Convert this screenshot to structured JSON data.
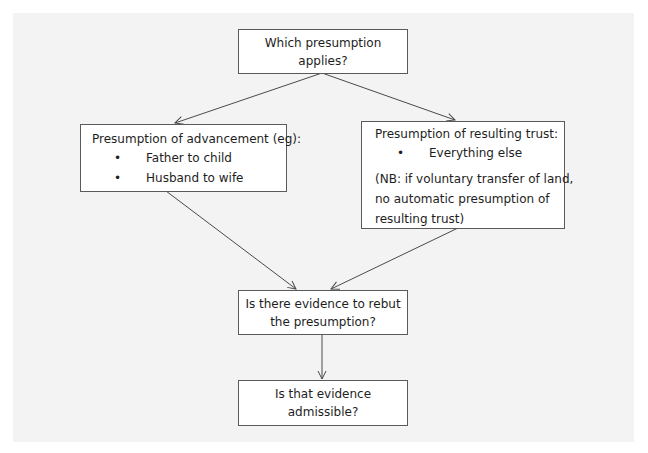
{
  "diagram": {
    "type": "flowchart",
    "nodes": {
      "start": {
        "label": "Which presumption applies?"
      },
      "advancement": {
        "heading": "Presumption of advancement (eg):",
        "items": [
          "Father to child",
          "Husband to wife"
        ]
      },
      "resulting_trust": {
        "heading": "Presumption of resulting trust:",
        "items": [
          "Everything else"
        ],
        "note_line1": "(NB: if voluntary transfer of land,",
        "note_line2": "no automatic presumption of",
        "note_line3": "resulting trust)"
      },
      "rebut": {
        "line1": "Is there evidence to rebut",
        "line2": "the presumption?"
      },
      "admissible": {
        "label": "Is that evidence admissible?"
      }
    },
    "edges": [
      {
        "from": "start",
        "to": "advancement"
      },
      {
        "from": "start",
        "to": "resulting_trust"
      },
      {
        "from": "advancement",
        "to": "rebut"
      },
      {
        "from": "resulting_trust",
        "to": "rebut"
      },
      {
        "from": "rebut",
        "to": "admissible"
      }
    ],
    "colors": {
      "panel_background": "#f3f3f3",
      "box_background": "#ffffff",
      "box_border": "#5a5a5a",
      "arrow": "#4a4a4a",
      "text": "#1e1e1e"
    }
  }
}
